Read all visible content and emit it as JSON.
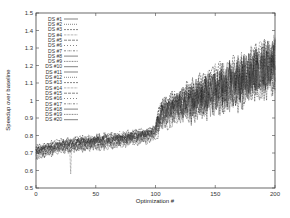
{
  "chart_data": {
    "type": "line",
    "title": "",
    "xlabel": "Optimization #",
    "ylabel": "Speedup over baseline",
    "xlim": [
      0,
      200
    ],
    "ylim": [
      0.5,
      1.5
    ],
    "x_ticks": [
      0,
      50,
      100,
      150,
      200
    ],
    "y_ticks": [
      0.5,
      0.6,
      0.7,
      0.8,
      0.9,
      1,
      1.1,
      1.2,
      1.3,
      1.4,
      1.5
    ],
    "y_tick_labels": [
      "0.5",
      "0.6",
      "0.7",
      "0.8",
      "0.9",
      "1",
      "1.1",
      "1.2",
      "1.3",
      "1.4",
      "1.5"
    ],
    "grid": false,
    "legend_position": "upper-left-inside",
    "series_count": 20,
    "series": [
      {
        "name": "DS #1"
      },
      {
        "name": "DS #2"
      },
      {
        "name": "DS #3"
      },
      {
        "name": "DS #4"
      },
      {
        "name": "DS #5"
      },
      {
        "name": "DS #6"
      },
      {
        "name": "DS #7"
      },
      {
        "name": "DS #8"
      },
      {
        "name": "DS #9"
      },
      {
        "name": "DS #10"
      },
      {
        "name": "DS #11"
      },
      {
        "name": "DS #12"
      },
      {
        "name": "DS #13"
      },
      {
        "name": "DS #14"
      },
      {
        "name": "DS #15"
      },
      {
        "name": "DS #16"
      },
      {
        "name": "DS #17"
      },
      {
        "name": "DS #18"
      },
      {
        "name": "DS #19"
      },
      {
        "name": "DS #20"
      }
    ],
    "trend": {
      "x": [
        0,
        10,
        25,
        50,
        75,
        95,
        100,
        105,
        125,
        150,
        175,
        200
      ],
      "mean": [
        0.7,
        0.72,
        0.74,
        0.76,
        0.78,
        0.8,
        0.82,
        0.92,
        0.98,
        1.05,
        1.12,
        1.2
      ],
      "spread_low": [
        0.67,
        0.69,
        0.71,
        0.73,
        0.75,
        0.76,
        0.78,
        0.85,
        0.88,
        0.9,
        0.92,
        0.95
      ],
      "spread_high": [
        0.74,
        0.76,
        0.79,
        0.82,
        0.84,
        0.84,
        0.87,
        1.02,
        1.15,
        1.3,
        1.38,
        1.45
      ]
    },
    "annotations": [
      {
        "note": "sharp downward spike",
        "x": 29,
        "y": 0.58
      },
      {
        "note": "step increase",
        "x": 100
      }
    ]
  },
  "colors": {
    "axis": "#333333",
    "series": "#1a1a1a",
    "background": "#ffffff"
  }
}
